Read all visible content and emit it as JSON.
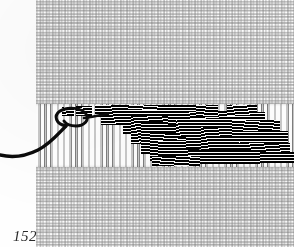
{
  "plate": {
    "folio": "152",
    "caption": "",
    "subject": "needlepoint-canvas-with-black-weft-stitching",
    "colors": {
      "paper": "#fefefe",
      "canvas_thread": "#8a8a8a",
      "warp_thread": "#7e7e7e",
      "stitch_thread": "#0a0a0a",
      "folio_ink": "#2b2b2b"
    },
    "canvas": {
      "label": "plain-weave ground canvas",
      "left": 36,
      "top": 0,
      "width": 258,
      "height": 247,
      "cell_px": 6.2
    },
    "warp_band": {
      "label": "exposed vertical warp threads",
      "left": 36,
      "top": 104,
      "width": 258,
      "height": 63,
      "pitch_px": 6.2
    },
    "stitch_field": {
      "label": "black weft stitching",
      "left": 36,
      "top": 104,
      "width": 258,
      "height": 63,
      "blocks": [
        {
          "x": 62,
          "y": 107,
          "w": 12,
          "h": 9,
          "style": "slant"
        },
        {
          "x": 76,
          "y": 106,
          "w": 16,
          "h": 10,
          "style": "slant"
        },
        {
          "x": 95,
          "y": 105,
          "w": 34,
          "h": 12,
          "style": "plain"
        },
        {
          "x": 101,
          "y": 105,
          "w": 22,
          "h": 20,
          "style": "slant"
        },
        {
          "x": 118,
          "y": 105,
          "w": 50,
          "h": 14,
          "style": "slant-b"
        },
        {
          "x": 123,
          "y": 110,
          "w": 45,
          "h": 24,
          "style": "plain"
        },
        {
          "x": 131,
          "y": 116,
          "w": 60,
          "h": 28,
          "style": "slant"
        },
        {
          "x": 141,
          "y": 122,
          "w": 58,
          "h": 32,
          "style": "plain"
        },
        {
          "x": 150,
          "y": 133,
          "w": 46,
          "h": 28,
          "style": "slant-b"
        },
        {
          "x": 158,
          "y": 141,
          "w": 40,
          "h": 24,
          "style": "plain"
        },
        {
          "x": 168,
          "y": 105,
          "w": 42,
          "h": 20,
          "style": "plain"
        },
        {
          "x": 176,
          "y": 111,
          "w": 56,
          "h": 26,
          "style": "slant"
        },
        {
          "x": 186,
          "y": 119,
          "w": 62,
          "h": 30,
          "style": "plain"
        },
        {
          "x": 196,
          "y": 105,
          "w": 22,
          "h": 12,
          "style": "slant-b"
        },
        {
          "x": 201,
          "y": 127,
          "w": 60,
          "h": 26,
          "style": "slant"
        },
        {
          "x": 209,
          "y": 137,
          "w": 58,
          "h": 22,
          "style": "plain"
        },
        {
          "x": 219,
          "y": 112,
          "w": 46,
          "h": 22,
          "style": "plain"
        },
        {
          "x": 227,
          "y": 105,
          "w": 30,
          "h": 11,
          "style": "slant"
        },
        {
          "x": 232,
          "y": 120,
          "w": 48,
          "h": 24,
          "style": "slant-b"
        },
        {
          "x": 240,
          "y": 131,
          "w": 48,
          "h": 22,
          "style": "plain"
        },
        {
          "x": 248,
          "y": 143,
          "w": 42,
          "h": 16,
          "style": "slant"
        },
        {
          "x": 252,
          "y": 152,
          "w": 42,
          "h": 11,
          "style": "plain"
        },
        {
          "x": 188,
          "y": 150,
          "w": 72,
          "h": 14,
          "style": "plain"
        },
        {
          "x": 152,
          "y": 156,
          "w": 48,
          "h": 10,
          "style": "slant-b"
        }
      ]
    },
    "working_thread": {
      "label": "loose working thread with loop",
      "stroke_hex": "#0b0b0b",
      "path": "M 0,155 C 12,158 26,156 38,150 C 50,144 58,134 66,126",
      "loop_path": "M 66,126 C 56,124 53,116 60,111 C 68,106 82,108 86,114 C 90,120 84,126 76,126 C 70,126 66,124 64,121",
      "tail_path": "M 84,118 C 92,117 100,115 108,114"
    }
  }
}
